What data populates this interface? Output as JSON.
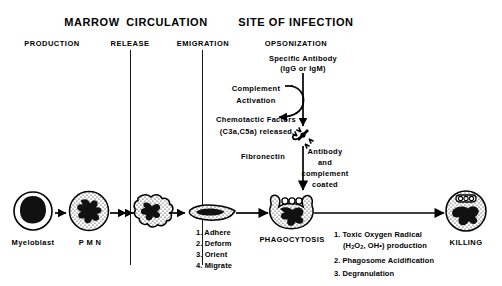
{
  "diagram": {
    "title_row": [
      {
        "name": "marrow",
        "label": "MARROW",
        "x": 92,
        "y": 17
      },
      {
        "name": "circulation",
        "label": "CIRCULATION",
        "x": 167,
        "y": 17
      },
      {
        "name": "site-of-infection",
        "label": "SITE OF INFECTION",
        "x": 296,
        "y": 17
      }
    ],
    "stage_row": [
      {
        "name": "production",
        "label": "PRODUCTION",
        "x": 52,
        "y": 39
      },
      {
        "name": "release",
        "label": "RELEASE",
        "x": 130,
        "y": 39
      },
      {
        "name": "emigration",
        "label": "EMIGRATION",
        "x": 203,
        "y": 39
      },
      {
        "name": "opsonization",
        "label": "OPSONIZATION",
        "x": 296,
        "y": 39
      }
    ],
    "annotations": {
      "specific_antibody_line1": "Specific Antibody",
      "specific_antibody_line2": "(IgG or IgM)",
      "complement_line1": "Complement",
      "complement_line2": "Activation",
      "chemotactic_line1": "Chemotactic Factors",
      "chemotactic_line2": "(C3a,C5a) released",
      "fibronectin": "Fibronectin",
      "coated_line1": "Antibody",
      "coated_line2": "and",
      "coated_line3": "complement",
      "coated_line4": "coated"
    },
    "cells": [
      {
        "name": "myeloblast",
        "label": "Myeloblast",
        "cx": 33,
        "cy": 211
      },
      {
        "name": "pmn",
        "label": "P M N",
        "cx": 89,
        "cy": 211
      },
      {
        "name": "emigrating-neutrophil",
        "label": "",
        "cx": 148,
        "cy": 211
      },
      {
        "name": "migrating-neutrophil",
        "label": "",
        "cx": 211,
        "cy": 214
      },
      {
        "name": "phagocytosing-neutrophil",
        "label": "PHAGOCYTOSIS",
        "cx": 292,
        "cy": 211
      },
      {
        "name": "killing-neutrophil",
        "label": "KILLING",
        "cx": 466,
        "cy": 211
      }
    ],
    "migration_steps": {
      "x": 196,
      "y": 227,
      "items": [
        "1. Adhere",
        "2. Deform",
        "3. Orient",
        "4. Migrate"
      ]
    },
    "killing_steps": {
      "x": 334,
      "y": 229,
      "items": [
        {
          "num": "1.",
          "line1_a": "Toxic Oxygen Radical",
          "line2_a": "(H",
          "sub1": "2",
          "line2_b": "O",
          "sub2": "2",
          "line2_c": ", OH",
          "sup": "•",
          "line2_d": ") production"
        },
        {
          "num": "2.",
          "line1_a": "Phagosome Acidification"
        },
        {
          "num": "3.",
          "line1_a": "Degranulation"
        }
      ]
    },
    "colors": {
      "ink": "#000000",
      "divider": "#1a1a1a",
      "background": "#ffffff",
      "nucleus": "#111111"
    }
  }
}
